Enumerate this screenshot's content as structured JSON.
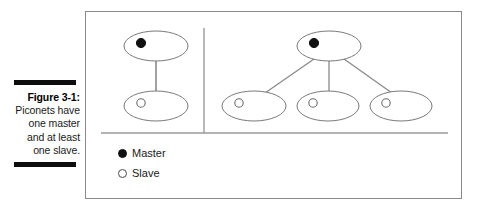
{
  "figure": {
    "caption_label": "Figure 3-1:",
    "caption_body": "Piconets have one master and at least one slave."
  },
  "colors": {
    "frame_border": "#8a8a8a",
    "node_stroke": "#7a7a7a",
    "link_stroke": "#8a8a8a",
    "divider_stroke": "#9a9a9a",
    "master_fill": "#111111",
    "slave_fill": "#ffffff",
    "rule_bar": "#0d0d0d",
    "text": "#1a1a1a"
  },
  "legend": {
    "items": [
      {
        "marker": "filled-circle-icon",
        "label": "Master"
      },
      {
        "marker": "hollow-circle-icon",
        "label": "Slave"
      }
    ]
  },
  "diagram": {
    "type": "node-link",
    "panels": [
      {
        "name": "piconet-one-slave",
        "nodes": [
          {
            "id": "m1",
            "role": "master",
            "cx": 70,
            "cy": 34,
            "rx": 32,
            "ry": 15,
            "dot_cx": 55,
            "dot_cy": 31
          },
          {
            "id": "s1",
            "role": "slave",
            "cx": 70,
            "cy": 94,
            "rx": 32,
            "ry": 15,
            "dot_cx": 55,
            "dot_cy": 91
          }
        ],
        "links": [
          {
            "from": "m1",
            "to": "s1",
            "x1": 70,
            "y1": 49,
            "x2": 70,
            "y2": 79
          }
        ]
      },
      {
        "name": "piconet-three-slaves",
        "nodes": [
          {
            "id": "m2",
            "role": "master",
            "cx": 243,
            "cy": 34,
            "rx": 32,
            "ry": 15,
            "dot_cx": 228,
            "dot_cy": 31
          },
          {
            "id": "s2",
            "role": "slave",
            "cx": 168,
            "cy": 94,
            "rx": 32,
            "ry": 15,
            "dot_cx": 153,
            "dot_cy": 91
          },
          {
            "id": "s3",
            "role": "slave",
            "cx": 242,
            "cy": 94,
            "rx": 31,
            "ry": 15,
            "dot_cx": 227,
            "dot_cy": 91
          },
          {
            "id": "s4",
            "role": "slave",
            "cx": 315,
            "cy": 94,
            "rx": 31,
            "ry": 15,
            "dot_cx": 300,
            "dot_cy": 91
          }
        ],
        "links": [
          {
            "from": "m2",
            "to": "s2",
            "x1": 228,
            "y1": 47,
            "x2": 179,
            "y2": 81
          },
          {
            "from": "m2",
            "to": "s3",
            "x1": 243,
            "y1": 49,
            "x2": 243,
            "y2": 79
          },
          {
            "from": "m2",
            "to": "s4",
            "x1": 258,
            "y1": 47,
            "x2": 306,
            "y2": 81
          }
        ]
      }
    ],
    "divider_vertical": {
      "x": 118,
      "y1": 16,
      "y2": 121
    },
    "divider_horizontal": {
      "y": 121,
      "x1": 15,
      "x2": 362
    }
  }
}
